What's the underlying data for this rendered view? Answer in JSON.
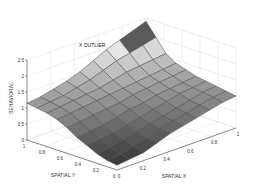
{
  "chart_data": {
    "type": "surface",
    "title": "",
    "xlabel": "SPATIAL X",
    "ylabel": "SPATIAL Y",
    "zlabel": "BEHAVIORAL",
    "xlim": [
      0,
      1
    ],
    "ylim": [
      0,
      1
    ],
    "zlim": [
      0,
      2.5
    ],
    "x_ticks": [
      "0",
      "0.2",
      "0.4",
      "0.6",
      "0.8",
      "1"
    ],
    "y_ticks": [
      "0",
      "0.2",
      "0.4",
      "0.6",
      "0.8",
      "1"
    ],
    "z_ticks": [
      "0",
      "0.5",
      "1",
      "1.5",
      "2",
      "2.5"
    ],
    "grid": true,
    "colormap": "gray",
    "annotations": [
      {
        "text": "X OUTLIER",
        "x": 0.05,
        "y": 0.95,
        "z": 2.1
      }
    ],
    "grid_size": [
      10,
      10
    ],
    "x": [
      0,
      0.111,
      0.222,
      0.333,
      0.444,
      0.556,
      0.667,
      0.778,
      0.889,
      1
    ],
    "y": [
      0,
      0.111,
      0.222,
      0.333,
      0.444,
      0.556,
      0.667,
      0.778,
      0.889,
      1
    ],
    "z": [
      [
        0.15,
        0.2,
        0.25,
        0.4,
        0.55,
        0.65,
        0.75,
        0.85,
        0.95,
        1.0
      ],
      [
        0.2,
        0.25,
        0.35,
        0.45,
        0.6,
        0.7,
        0.8,
        0.9,
        1.0,
        1.05
      ],
      [
        0.3,
        0.35,
        0.45,
        0.55,
        0.65,
        0.75,
        0.85,
        0.95,
        1.05,
        1.1
      ],
      [
        0.45,
        0.5,
        0.55,
        0.65,
        0.75,
        0.85,
        0.95,
        1.05,
        1.1,
        1.15
      ],
      [
        0.6,
        0.65,
        0.7,
        0.8,
        0.9,
        0.95,
        1.05,
        1.1,
        1.15,
        1.2
      ],
      [
        0.8,
        0.85,
        0.9,
        0.95,
        1.0,
        1.1,
        1.15,
        1.2,
        1.25,
        1.3
      ],
      [
        0.95,
        1.0,
        1.05,
        1.1,
        1.15,
        1.2,
        1.25,
        1.3,
        1.35,
        1.4
      ],
      [
        1.05,
        1.1,
        1.15,
        1.2,
        1.25,
        1.35,
        1.45,
        1.5,
        1.55,
        1.6
      ],
      [
        1.1,
        1.15,
        1.2,
        1.3,
        1.4,
        1.55,
        1.7,
        1.8,
        1.9,
        2.0
      ],
      [
        1.15,
        1.2,
        1.3,
        1.4,
        1.55,
        1.75,
        1.95,
        2.1,
        2.25,
        2.4
      ]
    ]
  },
  "colors": {
    "background": "#ffffff",
    "axis": "#444444",
    "grid": "#d8d8d8",
    "edge": "#4a4a4a"
  }
}
